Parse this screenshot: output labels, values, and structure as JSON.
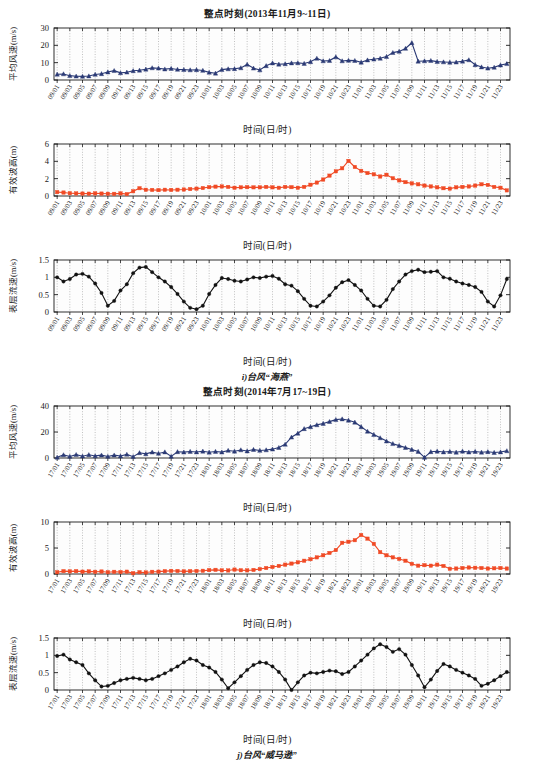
{
  "figure": {
    "top_caption": "i)台风“海燕”",
    "bottom_caption": "j)台风“威马逊”",
    "xaxis_label": "时间(日/时)",
    "colors": {
      "wind": "#2b3a75",
      "wave": "#f04a25",
      "current": "#111111",
      "grid": "#8a8a8a",
      "axis": "#1a1a1a",
      "background": "#ffffff"
    }
  },
  "group_a": {
    "title": "整点时刻(2013年11月9~11日)",
    "categories": [
      "09/01",
      "09/02",
      "09/03",
      "09/04",
      "09/05",
      "09/06",
      "09/07",
      "09/08",
      "09/09",
      "09/10",
      "09/11",
      "09/12",
      "09/13",
      "09/14",
      "09/15",
      "09/16",
      "09/17",
      "09/18",
      "09/19",
      "09/20",
      "09/21",
      "09/22",
      "09/23",
      "09/24",
      "10/01",
      "10/02",
      "10/03",
      "10/04",
      "10/05",
      "10/06",
      "10/07",
      "10/08",
      "10/09",
      "10/10",
      "10/11",
      "10/12",
      "10/13",
      "10/14",
      "10/15",
      "10/16",
      "10/17",
      "10/18",
      "10/19",
      "10/20",
      "10/21",
      "10/22",
      "10/23",
      "10/24",
      "11/01",
      "11/02",
      "11/03",
      "11/04",
      "11/05",
      "11/06",
      "11/07",
      "11/08",
      "11/09",
      "11/10",
      "11/11",
      "11/12",
      "11/13",
      "11/14",
      "11/15",
      "11/16",
      "11/17",
      "11/18",
      "11/19",
      "11/20",
      "11/21",
      "11/22",
      "11/23",
      "11/24"
    ],
    "tick_labels": [
      "09/01",
      "09/03",
      "09/05",
      "09/07",
      "09/09",
      "09/11",
      "09/13",
      "09/15",
      "09/17",
      "09/19",
      "09/21",
      "09/23",
      "10/01",
      "10/03",
      "10/05",
      "10/07",
      "10/09",
      "10/11",
      "10/13",
      "10/15",
      "10/17",
      "10/19",
      "10/21",
      "10/23",
      "11/01",
      "11/03",
      "11/05",
      "11/07",
      "11/09",
      "11/11",
      "11/13",
      "11/15",
      "11/17",
      "11/19",
      "11/21",
      "11/23"
    ]
  },
  "group_b": {
    "title": "整点时刻(2014年7月17~19日)",
    "categories": [
      "17/01",
      "17/02",
      "17/03",
      "17/04",
      "17/05",
      "17/06",
      "17/07",
      "17/08",
      "17/09",
      "17/10",
      "17/11",
      "17/12",
      "17/13",
      "17/14",
      "17/15",
      "17/16",
      "17/17",
      "17/18",
      "17/19",
      "17/20",
      "17/21",
      "17/22",
      "17/23",
      "17/24",
      "18/01",
      "18/02",
      "18/03",
      "18/04",
      "18/05",
      "18/06",
      "18/07",
      "18/08",
      "18/09",
      "18/10",
      "18/11",
      "18/12",
      "18/13",
      "18/14",
      "18/15",
      "18/16",
      "18/17",
      "18/18",
      "18/19",
      "18/20",
      "18/21",
      "18/22",
      "18/23",
      "18/24",
      "19/01",
      "19/02",
      "19/03",
      "19/04",
      "19/05",
      "19/06",
      "19/07",
      "19/08",
      "19/09",
      "19/10",
      "19/11",
      "19/12",
      "19/13",
      "19/14",
      "19/15",
      "19/16",
      "19/17",
      "19/18",
      "19/19",
      "19/20",
      "19/21",
      "19/22",
      "19/23",
      "19/24"
    ],
    "tick_labels": [
      "17/01",
      "17/03",
      "17/05",
      "17/07",
      "17/09",
      "17/11",
      "17/13",
      "17/15",
      "17/17",
      "17/19",
      "17/21",
      "17/23",
      "18/01",
      "18/03",
      "18/05",
      "18/07",
      "18/09",
      "18/11",
      "18/13",
      "18/15",
      "18/17",
      "18/19",
      "18/21",
      "18/23",
      "19/01",
      "19/03",
      "19/05",
      "19/07",
      "19/09",
      "19/11",
      "19/13",
      "19/15",
      "19/17",
      "19/19",
      "19/21",
      "19/23"
    ]
  },
  "chart_data": [
    {
      "id": "a1-wind",
      "type": "line",
      "title": "整点时刻(2013年11月9~11日)",
      "xlabel": "时间(日/时)",
      "ylabel": "平均风速(m/s)",
      "ylim": [
        0,
        30
      ],
      "yticks": [
        0,
        10,
        20,
        30
      ],
      "grid": true,
      "marker": "triangle",
      "color": "#2b3a75",
      "series": [
        {
          "name": "平均风速",
          "values": [
            3.3,
            3.5,
            2.5,
            2.2,
            2.1,
            2.3,
            3.2,
            3.6,
            4.6,
            5.4,
            4.1,
            4.5,
            5.3,
            5.6,
            6.2,
            7.0,
            6.8,
            6.3,
            6.6,
            6.1,
            6.0,
            5.8,
            5.9,
            5.5,
            4.4,
            3.9,
            6.0,
            6.4,
            6.5,
            7.0,
            9.0,
            6.8,
            5.8,
            8.2,
            9.8,
            9.1,
            9.3,
            9.8,
            9.9,
            9.5,
            10.5,
            12.5,
            11.0,
            11.2,
            13.3,
            11.0,
            11.3,
            11.2,
            10.2,
            11.5,
            12.0,
            12.5,
            13.5,
            15.8,
            16.5,
            18.2,
            21.5,
            10.8,
            11.0,
            11.2,
            10.6,
            10.4,
            10.2,
            10.3,
            10.8,
            11.6,
            8.8,
            7.5,
            6.8,
            7.3,
            8.6,
            9.4
          ]
        }
      ]
    },
    {
      "id": "a2-wave",
      "type": "line",
      "title": "",
      "xlabel": "时间(日/时)",
      "ylabel": "有效波高(m)",
      "ylim": [
        0,
        6
      ],
      "yticks": [
        0,
        2,
        4,
        6
      ],
      "grid": true,
      "marker": "square",
      "color": "#f04a25",
      "series": [
        {
          "name": "有效波高",
          "values": [
            0.45,
            0.4,
            0.32,
            0.3,
            0.28,
            0.27,
            0.3,
            0.28,
            0.26,
            0.25,
            0.3,
            0.22,
            0.55,
            0.9,
            0.72,
            0.7,
            0.68,
            0.72,
            0.7,
            0.72,
            0.75,
            0.8,
            0.85,
            0.92,
            1.02,
            1.08,
            1.1,
            1.05,
            0.95,
            1.0,
            1.02,
            1.0,
            1.0,
            1.05,
            1.0,
            0.95,
            1.05,
            1.02,
            0.95,
            1.05,
            1.3,
            1.55,
            1.9,
            2.35,
            2.85,
            3.2,
            4.05,
            3.35,
            2.9,
            2.65,
            2.5,
            2.25,
            2.45,
            2.05,
            1.8,
            1.6,
            1.45,
            1.35,
            1.2,
            1.1,
            1.0,
            0.9,
            0.85,
            1.0,
            1.05,
            1.1,
            1.2,
            1.35,
            1.28,
            1.05,
            0.95,
            0.65
          ]
        }
      ]
    },
    {
      "id": "a3-current",
      "type": "line",
      "title": "",
      "xlabel": "时间(日/时)",
      "ylabel": "表层流速(m/s)",
      "ylim": [
        0,
        1.5
      ],
      "yticks": [
        0,
        0.5,
        1,
        1.5
      ],
      "grid": true,
      "marker": "circle",
      "color": "#111111",
      "series": [
        {
          "name": "表层流速",
          "values": [
            1.0,
            0.88,
            0.95,
            1.08,
            1.1,
            1.02,
            0.82,
            0.55,
            0.18,
            0.32,
            0.62,
            0.8,
            1.12,
            1.28,
            1.3,
            1.15,
            1.0,
            0.88,
            0.72,
            0.52,
            0.3,
            0.12,
            0.08,
            0.18,
            0.52,
            0.78,
            0.98,
            0.95,
            0.9,
            0.88,
            0.94,
            1.0,
            0.98,
            1.02,
            1.04,
            0.96,
            0.8,
            0.76,
            0.6,
            0.38,
            0.18,
            0.16,
            0.3,
            0.48,
            0.7,
            0.86,
            0.92,
            0.78,
            0.62,
            0.38,
            0.18,
            0.16,
            0.35,
            0.66,
            0.88,
            1.08,
            1.18,
            1.22,
            1.15,
            1.16,
            1.18,
            1.0,
            0.96,
            0.88,
            0.82,
            0.78,
            0.72,
            0.58,
            0.3,
            0.16,
            0.48,
            0.95
          ]
        }
      ]
    },
    {
      "id": "b1-wind",
      "type": "line",
      "title": "整点时刻(2014年7月17~19日)",
      "xlabel": "时间(日/时)",
      "ylabel": "平均风速(m/s)",
      "ylim": [
        0,
        40
      ],
      "yticks": [
        0,
        20,
        40
      ],
      "grid": true,
      "marker": "triangle",
      "color": "#2b3a75",
      "series": [
        {
          "name": "平均风速",
          "values": [
            0.5,
            2.4,
            1.2,
            2.6,
            1.4,
            2.5,
            1.6,
            2.2,
            1.2,
            2.2,
            1.5,
            2.8,
            1.0,
            4.0,
            3.2,
            4.5,
            3.5,
            4.6,
            1.2,
            4.8,
            4.5,
            5.0,
            4.6,
            5.2,
            4.4,
            5.0,
            4.5,
            5.8,
            5.2,
            6.2,
            5.4,
            6.5,
            5.8,
            6.2,
            6.8,
            8.0,
            10.5,
            16.0,
            19.0,
            22.5,
            24.0,
            25.5,
            26.5,
            28.0,
            29.5,
            30.0,
            29.0,
            27.5,
            24.0,
            20.5,
            18.0,
            15.5,
            13.0,
            11.0,
            9.5,
            8.0,
            6.5,
            5.0,
            0.5,
            4.8,
            5.2,
            4.6,
            5.0,
            4.4,
            5.2,
            4.5,
            5.0,
            4.4,
            4.8,
            4.2,
            4.6,
            5.5
          ]
        }
      ]
    },
    {
      "id": "b2-wave",
      "type": "line",
      "title": "",
      "xlabel": "时间(日/时)",
      "ylabel": "有效波高(m)",
      "ylim": [
        0,
        10
      ],
      "yticks": [
        0,
        5,
        10
      ],
      "grid": true,
      "marker": "square",
      "color": "#f04a25",
      "series": [
        {
          "name": "有效波高",
          "values": [
            0.35,
            0.55,
            0.5,
            0.55,
            0.45,
            0.5,
            0.42,
            0.48,
            0.35,
            0.42,
            0.38,
            0.45,
            0.15,
            0.35,
            0.3,
            0.42,
            0.45,
            0.55,
            0.6,
            0.58,
            0.5,
            0.55,
            0.58,
            0.62,
            0.75,
            0.8,
            0.7,
            0.68,
            0.85,
            0.72,
            0.7,
            0.78,
            0.95,
            1.15,
            1.35,
            1.55,
            1.8,
            2.0,
            2.25,
            2.55,
            2.85,
            3.2,
            3.6,
            4.05,
            4.6,
            6.0,
            6.2,
            6.5,
            7.5,
            6.8,
            5.8,
            4.2,
            3.6,
            3.2,
            2.9,
            2.55,
            1.95,
            1.6,
            1.7,
            1.6,
            1.8,
            1.55,
            1.0,
            1.05,
            1.15,
            1.25,
            1.2,
            1.15,
            1.05,
            1.1,
            1.15,
            1.05
          ]
        }
      ]
    },
    {
      "id": "b3-current",
      "type": "line",
      "title": "",
      "xlabel": "时间(日/时)",
      "ylabel": "表层流速(m/s)",
      "ylim": [
        0,
        1.5
      ],
      "yticks": [
        0,
        0.5,
        1,
        1.5
      ],
      "grid": true,
      "marker": "circle",
      "color": "#111111",
      "series": [
        {
          "name": "表层流速",
          "values": [
            0.98,
            1.02,
            0.88,
            0.8,
            0.72,
            0.48,
            0.28,
            0.1,
            0.12,
            0.2,
            0.28,
            0.32,
            0.35,
            0.32,
            0.28,
            0.32,
            0.4,
            0.48,
            0.58,
            0.68,
            0.8,
            0.9,
            0.85,
            0.72,
            0.65,
            0.52,
            0.3,
            0.05,
            0.22,
            0.4,
            0.58,
            0.72,
            0.8,
            0.78,
            0.68,
            0.52,
            0.3,
            0.0,
            0.22,
            0.42,
            0.5,
            0.48,
            0.52,
            0.56,
            0.54,
            0.46,
            0.52,
            0.68,
            0.85,
            1.02,
            1.2,
            1.32,
            1.24,
            1.1,
            1.18,
            1.02,
            0.72,
            0.42,
            0.08,
            0.3,
            0.55,
            0.75,
            0.68,
            0.58,
            0.5,
            0.42,
            0.32,
            0.12,
            0.18,
            0.28,
            0.4,
            0.52
          ]
        }
      ]
    }
  ]
}
